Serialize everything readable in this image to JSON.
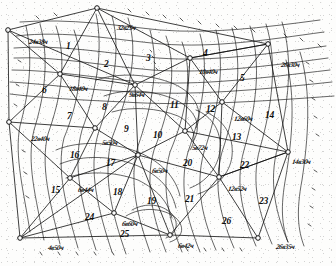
{
  "figure": {
    "kind": "geodetic-triangulation-network-scan",
    "ink_color": "#111111",
    "paper_color": "#fdfdfc"
  },
  "stations": [
    {
      "id": "s1",
      "label": "24в38ч",
      "x": 8,
      "y": 30,
      "nx": 29,
      "ny": 38
    },
    {
      "id": "s2",
      "label": "32в25ч",
      "x": 97,
      "y": 8,
      "nx": 117,
      "ny": 24
    },
    {
      "id": "s3",
      "label": "26в30ч",
      "x": 268,
      "y": 44,
      "nx": 281,
      "ny": 61
    },
    {
      "id": "s4",
      "label": "10в40ч",
      "x": 190,
      "y": 58,
      "nx": 199,
      "ny": 68
    },
    {
      "id": "s5",
      "label": "18в40ч",
      "x": 60,
      "y": 74,
      "nx": 69,
      "ny": 85
    },
    {
      "id": "s6",
      "label": "9в64ч",
      "x": 135,
      "y": 85,
      "nx": 129,
      "ny": 91
    },
    {
      "id": "s7",
      "label": "12в60ч",
      "x": 222,
      "y": 102,
      "nx": 234,
      "ny": 115
    },
    {
      "id": "s8",
      "label": "22в40ч",
      "x": 9,
      "y": 122,
      "nx": 31,
      "ny": 135
    },
    {
      "id": "s9",
      "label": "5в50ч",
      "x": 95,
      "y": 128,
      "nx": 102,
      "ny": 139
    },
    {
      "id": "s10",
      "label": "5в72ч",
      "x": 185,
      "y": 131,
      "nx": 192,
      "ny": 144
    },
    {
      "id": "s11",
      "label": "14в30ч",
      "x": 288,
      "y": 152,
      "nx": 292,
      "ny": 158
    },
    {
      "id": "s12",
      "label": "6в50ч",
      "x": 138,
      "y": 155,
      "nx": 152,
      "ny": 167
    },
    {
      "id": "s13",
      "label": "12в52ч",
      "x": 219,
      "y": 177,
      "nx": 228,
      "ny": 185
    },
    {
      "id": "s14",
      "label": "6в44ч",
      "x": 70,
      "y": 178,
      "nx": 78,
      "ny": 186
    },
    {
      "id": "s15",
      "label": "6в60ч",
      "x": 114,
      "y": 213,
      "nx": 122,
      "ny": 220
    },
    {
      "id": "s16",
      "label": "4в50ч",
      "x": 20,
      "y": 238,
      "nx": 48,
      "ny": 244
    },
    {
      "id": "s17",
      "label": "6в42ч",
      "x": 170,
      "y": 235,
      "nx": 178,
      "ny": 242
    },
    {
      "id": "s18",
      "label": "26в35ч",
      "x": 258,
      "y": 238,
      "nx": 276,
      "ny": 243
    }
  ],
  "regions": [
    {
      "n": "1",
      "x": 66,
      "y": 41
    },
    {
      "n": "2",
      "x": 104,
      "y": 59
    },
    {
      "n": "3",
      "x": 146,
      "y": 53
    },
    {
      "n": "4",
      "x": 203,
      "y": 48
    },
    {
      "n": "5",
      "x": 240,
      "y": 73
    },
    {
      "n": "6",
      "x": 42,
      "y": 85
    },
    {
      "n": "7",
      "x": 67,
      "y": 111
    },
    {
      "n": "8",
      "x": 102,
      "y": 102
    },
    {
      "n": "9",
      "x": 124,
      "y": 124
    },
    {
      "n": "10",
      "x": 153,
      "y": 130
    },
    {
      "n": "11",
      "x": 170,
      "y": 100
    },
    {
      "n": "12",
      "x": 206,
      "y": 104
    },
    {
      "n": "13",
      "x": 232,
      "y": 132
    },
    {
      "n": "14",
      "x": 265,
      "y": 110
    },
    {
      "n": "15",
      "x": 51,
      "y": 185
    },
    {
      "n": "16",
      "x": 70,
      "y": 150
    },
    {
      "n": "17",
      "x": 106,
      "y": 158
    },
    {
      "n": "18",
      "x": 113,
      "y": 187
    },
    {
      "n": "19",
      "x": 147,
      "y": 196
    },
    {
      "n": "20",
      "x": 183,
      "y": 158
    },
    {
      "n": "21",
      "x": 185,
      "y": 194
    },
    {
      "n": "22",
      "x": 240,
      "y": 160
    },
    {
      "n": "23",
      "x": 259,
      "y": 196
    },
    {
      "n": "24",
      "x": 85,
      "y": 212
    },
    {
      "n": "25",
      "x": 120,
      "y": 229
    },
    {
      "n": "26",
      "x": 222,
      "y": 216
    }
  ],
  "edge_ticks": {
    "top": [
      "36",
      "37",
      "38",
      "39",
      "40",
      "41",
      "42",
      "43",
      "44",
      "45",
      "46",
      "47"
    ],
    "right": [
      "48",
      "49",
      "50",
      "51",
      "52",
      "53",
      "54",
      "55"
    ],
    "bottom": [
      "1",
      "2",
      "3",
      "4",
      "5",
      "6",
      "7",
      "8",
      "9",
      "10",
      "11",
      "12",
      "13"
    ],
    "left": [
      "26",
      "27",
      "28",
      "29",
      "30",
      "31"
    ]
  }
}
